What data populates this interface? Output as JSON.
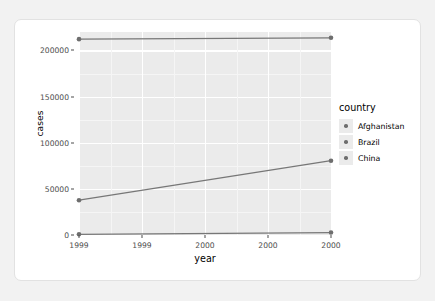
{
  "chart_data": {
    "type": "line",
    "title": "",
    "xlabel": "year",
    "ylabel": "cases",
    "xlim": [
      1999,
      2000
    ],
    "ylim": [
      0,
      220000
    ],
    "grid": true,
    "legend_position": "right",
    "legend_title": "country",
    "x": [
      1999,
      2000
    ],
    "x_tick_values": [
      1999,
      1999.25,
      1999.5,
      1999.75,
      2000
    ],
    "x_tick_labels": [
      "1999",
      "1999",
      "2000",
      "2000",
      "2000"
    ],
    "y_tick_values": [
      0,
      50000,
      100000,
      150000,
      200000
    ],
    "y_tick_labels": [
      "0",
      "50000",
      "100000",
      "150000",
      "200000"
    ],
    "series": [
      {
        "name": "Afghanistan",
        "values": [
          745,
          2666
        ],
        "color": "#6e6e6e"
      },
      {
        "name": "Brazil",
        "values": [
          37737,
          80488
        ],
        "color": "#6e6e6e"
      },
      {
        "name": "China",
        "values": [
          212258,
          213766
        ],
        "color": "#6e6e6e"
      }
    ]
  },
  "legend": {
    "title": "country",
    "items": [
      {
        "label": "Afghanistan"
      },
      {
        "label": "Brazil"
      },
      {
        "label": "China"
      }
    ]
  },
  "colors": {
    "panel_background": "#ebebeb",
    "gridline_major": "#ffffff",
    "gridline_minor": "#f5f5f5",
    "series_stroke": "#777777",
    "point_fill": "#6e6e6e",
    "card_background": "#ffffff",
    "page_background": "#f2f2f2",
    "axis_text": "#4d4d4d"
  }
}
